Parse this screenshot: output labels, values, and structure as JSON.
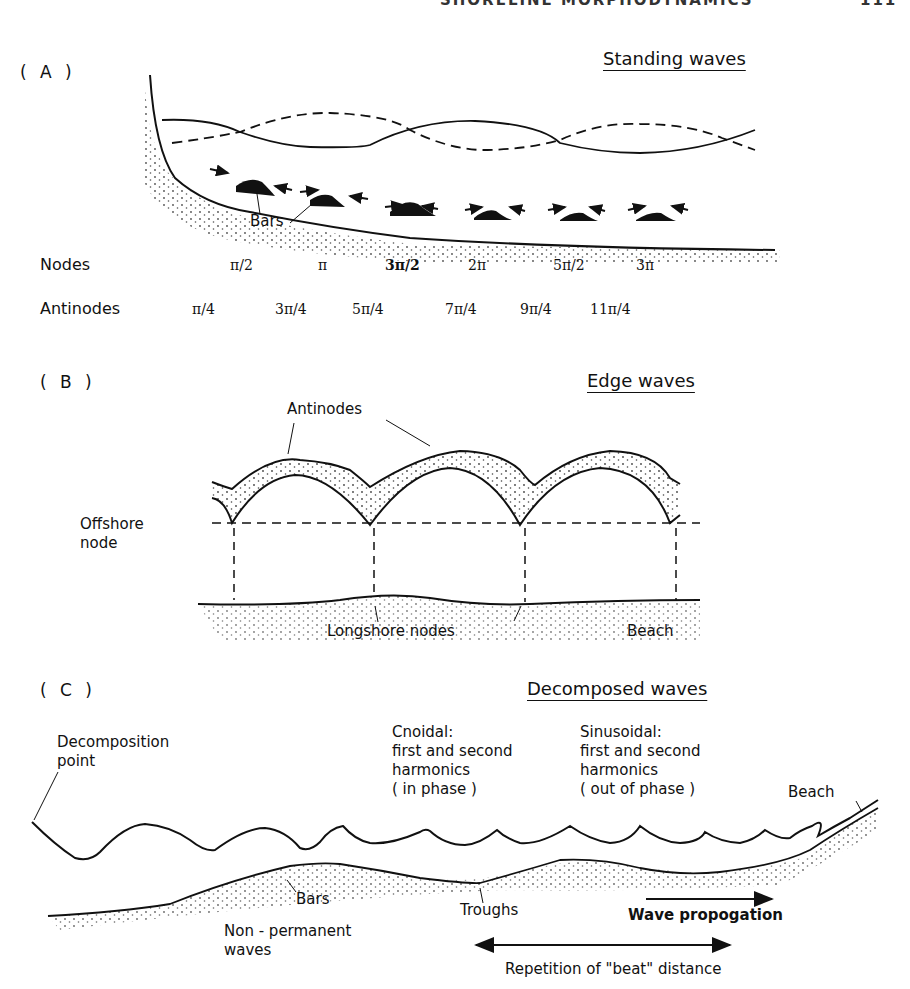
{
  "page_header": {
    "running_title": "SHORELINE MORPHODYNAMICS",
    "page_number": "111"
  },
  "panel_a": {
    "label": "( A )",
    "title": "Standing waves",
    "bars_label": "Bars",
    "nodes": {
      "row_label": "Nodes",
      "values": [
        "π/2",
        "π",
        "3π/2",
        "2π",
        "5π/2",
        "3π"
      ]
    },
    "antinodes": {
      "row_label": "Antinodes",
      "values": [
        "π/4",
        "3π/4",
        "5π/4",
        "7π/4",
        "9π/4",
        "11π/4"
      ]
    }
  },
  "panel_b": {
    "label": "( B )",
    "title": "Edge waves",
    "antinodes_label": "Antinodes",
    "offshore_node_label_line1": "Offshore",
    "offshore_node_label_line2": "node",
    "longshore_nodes_label": "Longshore nodes",
    "beach_label": "Beach"
  },
  "panel_c": {
    "label": "( C )",
    "title": "Decomposed waves",
    "decomposition_point": [
      "Decomposition",
      "point"
    ],
    "cnoidal": [
      "Cnoidal:",
      "first and second",
      "harmonics",
      "( in phase )"
    ],
    "sinusoidal": [
      "Sinusoidal:",
      "first and second",
      "harmonics",
      "( out of phase )"
    ],
    "beach_label": "Beach",
    "bars_label": "Bars",
    "troughs_label": "Troughs",
    "non_permanent": [
      "Non - permanent",
      "waves"
    ],
    "wave_propagation_label": "Wave propogation",
    "beat_distance_label": "Repetition of \"beat\" distance"
  }
}
